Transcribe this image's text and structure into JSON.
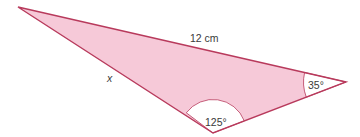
{
  "diagram": {
    "type": "triangle",
    "colors": {
      "fill": "#f6c9d8",
      "stroke": "#b83a5c",
      "angle_fill": "#ffffff",
      "text": "#3a3a3a"
    },
    "vertices": {
      "top_left": [
        18,
        7
      ],
      "right": [
        346,
        82
      ],
      "bottom": [
        213,
        133
      ]
    },
    "labels": {
      "top_side": "12 cm",
      "left_side": "x",
      "bottom_angle": "125°",
      "right_angle": "35°"
    }
  }
}
